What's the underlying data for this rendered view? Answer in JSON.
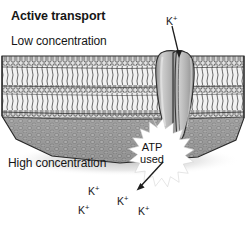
{
  "figure": {
    "title": "Active transport",
    "width": 246,
    "height": 225,
    "background_color": "#ffffff"
  },
  "labels": {
    "top_region": "Low concentration",
    "bottom_region": "High concentration",
    "energy_line1": "ATP",
    "energy_line2": "used"
  },
  "ions": {
    "symbol": "K",
    "charge": "+",
    "outside": [
      {
        "id": "ion-top",
        "x": 166,
        "y": 16
      }
    ],
    "inside": [
      {
        "id": "ion-b1",
        "x": 88,
        "y": 186
      },
      {
        "id": "ion-b2",
        "x": 78,
        "y": 205
      },
      {
        "id": "ion-b3",
        "x": 117,
        "y": 196
      },
      {
        "id": "ion-b4",
        "x": 138,
        "y": 206
      }
    ]
  },
  "colors": {
    "ink": "#1a1a1a",
    "membrane_head_fill": "#d8d8d8",
    "membrane_tail_fill": "#efefef",
    "membrane_face_fill": "#9a9a9a",
    "membrane_face_dark": "#6f6f6f",
    "protein_fill": "#b4b4b4",
    "protein_highlight": "#d2d2d2",
    "starburst_fill": "#ffffff",
    "shadow": "#cfcfcf",
    "background": "#ffffff"
  },
  "annotations": {
    "arrow_in": "arrow from extracellular K+ down into transport protein channel",
    "arrow_out": "arrow from ATP burst down-left toward intracellular K+ ions"
  }
}
